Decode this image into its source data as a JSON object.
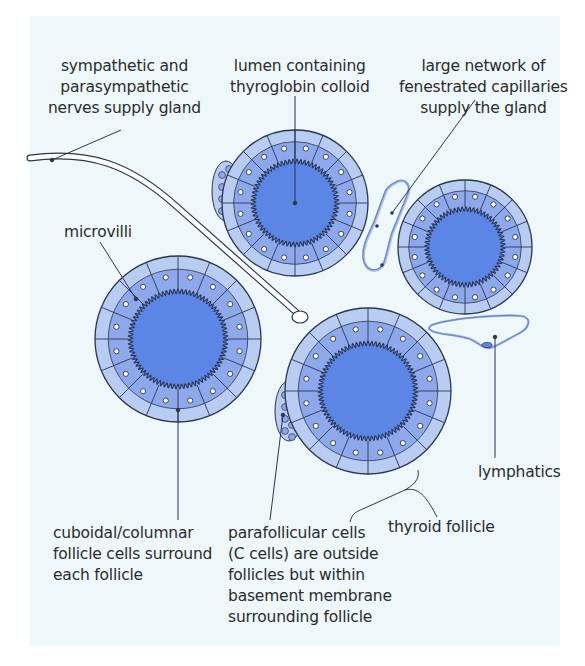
{
  "colors": {
    "background": "#eef8fb",
    "lumen": "#5b86e6",
    "cells": "#8ea8ec",
    "outer_ring": "#b9ccf2",
    "outline": "#2a3550",
    "text": "#2b2b2b"
  },
  "labels": {
    "nerves": "sympathetic and\nparasympathetic\nnerves supply gland",
    "lumen": "lumen containing\nthyroglobin colloid",
    "capillaries": "large network of\nfenestrated capillaries\nsupply the gland",
    "microvilli": "microvilli",
    "follicle_cells": "cuboidal/columnar\nfollicle cells surround\neach follicle",
    "parafollicular": "parafollicular cells\n(C cells) are outside\nfollicles but within\nbasement membrane\nsurrounding follicle",
    "thyroid_follicle": "thyroid follicle",
    "lymphatics": "lymphatics"
  },
  "structures": {
    "follicles": [
      {
        "id": "top-center",
        "cx": 295,
        "cy": 203,
        "r": 73
      },
      {
        "id": "right",
        "cx": 465,
        "cy": 247,
        "r": 67
      },
      {
        "id": "left",
        "cx": 178,
        "cy": 339,
        "r": 83
      },
      {
        "id": "bottom-center",
        "cx": 368,
        "cy": 391,
        "r": 83
      }
    ],
    "parafollicular_clusters": [
      "top-center",
      "bottom-center"
    ],
    "nerve_fiber": "from left edge to terminal bulb near (300, 318)",
    "capillary": "elongated loop between top-center and right follicles",
    "lymphatic_vessel": "crescent vessel below right follicle"
  }
}
